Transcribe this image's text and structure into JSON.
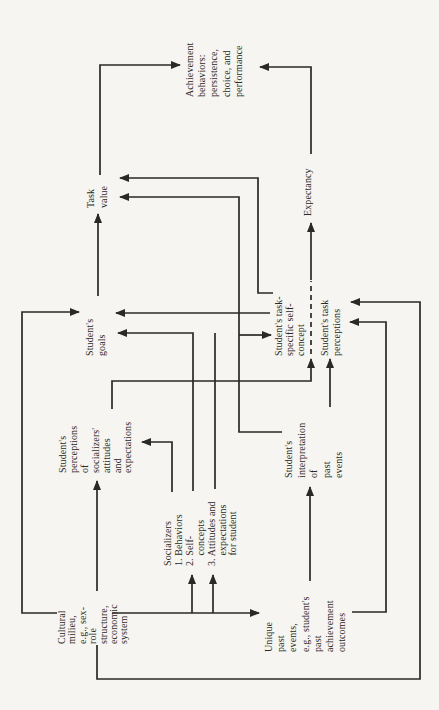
{
  "figure": {
    "type": "flowchart",
    "orientation": "printed rotated 90° counterclockwise (text reads bottom-to-top)",
    "colors": {
      "paper": "#f6f5f1",
      "ink": "#2b2925"
    },
    "nodes": {
      "cultural": "Cultural\nmilieu,\ne.g., sex-\nrole\nstructure,\neconomic\nsystem",
      "socializers": "Socializers\n1. Behaviors\n2. Self-\n    concepts\n3. Attitudes and\n    expectations\n    for student",
      "unique": "Unique\npast\nevents,\ne.g., student's\npast\nachievement\noutcomes",
      "perceptions": "Student's\nperceptions\nof\nsocializers'\nattitudes\nand\nexpectations",
      "interpretation": "Student's\ninterpretation\nof\npast\nevents",
      "goals": "Student's\ngoals",
      "self_concept": "Student's task-\nspecific self-\nconcept",
      "task_perceptions": "Student's task\nperceptions",
      "task_value": "Task\nvalue",
      "expectancy": "Expectancy",
      "achievement": "Achievement\nbehaviors:\npersistence,\nchoice, and\nperformance"
    },
    "edges": [
      {
        "from": "cultural-milieu",
        "to": "student-goals"
      },
      {
        "from": "cultural-milieu",
        "to": "student-perceptions"
      },
      {
        "from": "cultural-milieu",
        "to": "socializers",
        "note": "two parallel arrows"
      },
      {
        "from": "cultural-milieu",
        "to": "unique-past-events"
      },
      {
        "from": "cultural-milieu",
        "to": "task-perceptions",
        "route": "outer feedback loop"
      },
      {
        "from": "unique-past-events",
        "to": "interpretation"
      },
      {
        "from": "unique-past-events",
        "to": "task-perceptions",
        "route": "lower loop"
      },
      {
        "from": "socializers",
        "to": "student-perceptions"
      },
      {
        "from": "socializers",
        "to": "student-goals",
        "note": "two risers merge"
      },
      {
        "from": "student-perceptions",
        "to": "student-goals"
      },
      {
        "from": "student-perceptions",
        "to": "self-concept-boundary"
      },
      {
        "from": "interpretation",
        "to": "task-value"
      },
      {
        "from": "interpretation",
        "to": "self-concept",
        "note": "fork of task-value line"
      },
      {
        "from": "interpretation",
        "to": "task-perceptions"
      },
      {
        "from": "self-concept",
        "to": "task-value"
      },
      {
        "from": "self-concept",
        "to": "student-goals"
      },
      {
        "from": "self-concept",
        "to": "expectancy",
        "style": "dashed then solid"
      },
      {
        "from": "student-goals",
        "to": "task-value"
      },
      {
        "from": "task-value",
        "to": "achievement-behaviors"
      },
      {
        "from": "expectancy",
        "to": "achievement-behaviors"
      }
    ]
  }
}
